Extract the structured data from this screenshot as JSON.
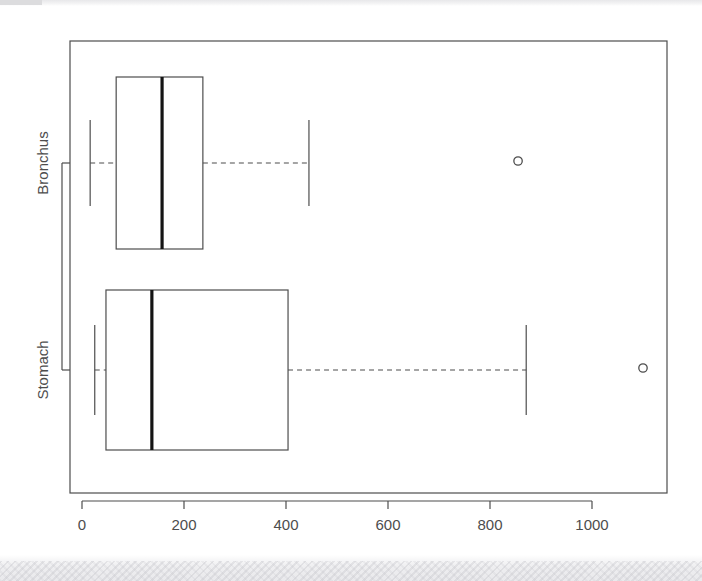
{
  "chart_data": {
    "type": "box",
    "orientation": "horizontal",
    "title": "",
    "xlabel": "",
    "ylabel": "",
    "xlim": [
      -8,
      1150
    ],
    "xticks": [
      0,
      200,
      400,
      600,
      800,
      1000
    ],
    "xticklabels": [
      "0",
      "200",
      "400",
      "600",
      "800",
      "1000"
    ],
    "categories": [
      "Bronchus",
      "Stomach"
    ],
    "grid": false,
    "legend": null,
    "frame": true,
    "boxes": [
      {
        "label": "Bronchus",
        "whisker_low": 16,
        "q1": 67,
        "median": 157,
        "q3": 237,
        "whisker_high": 445,
        "outliers": [
          855
        ]
      },
      {
        "label": "Stomach",
        "whisker_low": 25,
        "q1": 47,
        "median": 137,
        "q3": 404,
        "whisker_high": 871,
        "outliers": [
          1100
        ]
      }
    ]
  },
  "style": {
    "line_color": "#4d4d4d",
    "median_color": "#141414",
    "background": "#ffffff",
    "tick_label_color": "#4d4d4d"
  },
  "axis": {
    "x_tick_labels": [
      "0",
      "200",
      "400",
      "600",
      "800",
      "1000"
    ],
    "y_tick_labels": [
      "Bronchus",
      "Stomach"
    ]
  }
}
